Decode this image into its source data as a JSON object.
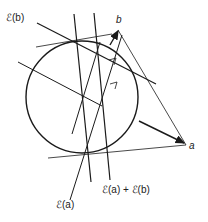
{
  "labels": {
    "e_b": "ℰ(b)",
    "b": "b",
    "a": "a",
    "e_a": "ℰ(a)",
    "e_sum": "ℰ(a) + ℰ(b)"
  },
  "colors": {
    "stroke": "#1a1a1a",
    "background": "#ffffff"
  },
  "circle": {
    "cx": 82,
    "cy": 97,
    "r": 56
  }
}
